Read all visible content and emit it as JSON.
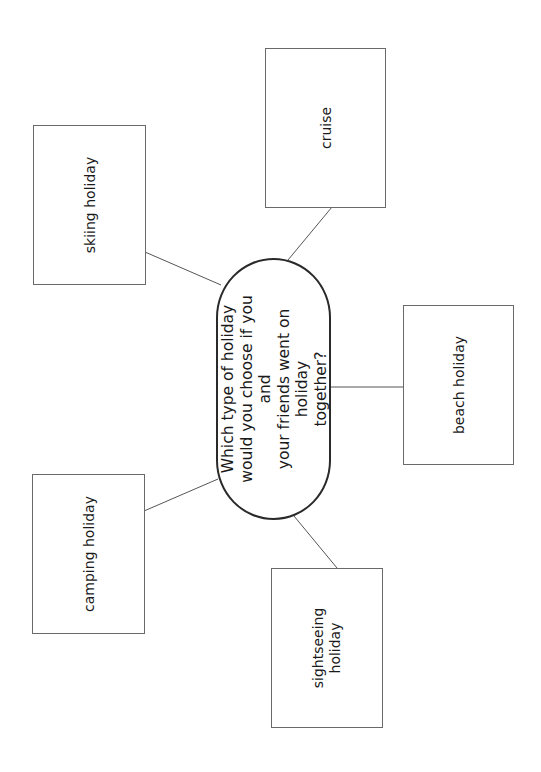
{
  "diagram": {
    "type": "mind-map",
    "central_question": {
      "lines": [
        "Which type of holiday",
        "would you choose if you and",
        "your friends went on holiday",
        "together?"
      ]
    },
    "options": [
      {
        "id": "skiing",
        "lines": [
          "skiing holiday"
        ]
      },
      {
        "id": "cruise",
        "lines": [
          "cruise"
        ]
      },
      {
        "id": "beach",
        "lines": [
          "beach holiday"
        ]
      },
      {
        "id": "camping",
        "lines": [
          "camping holiday"
        ]
      },
      {
        "id": "sightseeing",
        "lines": [
          "sightseeing",
          "holiday"
        ]
      }
    ],
    "colors": {
      "box_border": "#6a6a6a",
      "oval_border": "#2a2a2a",
      "connector": "#555555",
      "text": "#1a1a1a",
      "background": "#ffffff"
    }
  }
}
